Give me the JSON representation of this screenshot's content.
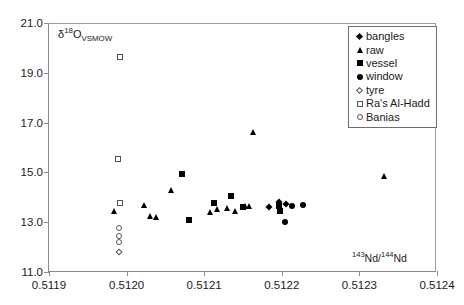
{
  "chart_data": {
    "type": "scatter",
    "title": "",
    "xlabel": "143Nd/144Nd",
    "ylabel": "d18O VSMOW",
    "xlabel_parts": {
      "sup1": "143",
      "mid": "Nd/",
      "sup2": "144",
      "end": "Nd"
    },
    "ylabel_parts": {
      "delta": "δ",
      "sup": "18",
      "element": "O",
      "sub": "VSMOW"
    },
    "xlim": [
      0.5119,
      0.5124
    ],
    "ylim": [
      11.0,
      21.0
    ],
    "xticks": [
      0.5119,
      0.512,
      0.5121,
      0.5122,
      0.5123,
      0.5124
    ],
    "xtick_labels": [
      "0.5119",
      "0.5120",
      "0.5121",
      "0.5122",
      "0.5123",
      "0.5124"
    ],
    "yticks": [
      11.0,
      13.0,
      15.0,
      17.0,
      19.0,
      21.0
    ],
    "ytick_labels": [
      "11.0",
      "13.0",
      "15.0",
      "17.0",
      "19.0",
      "21.0"
    ],
    "grid": false,
    "legend_position": "top-right",
    "marker_color": "#000000",
    "open_marker_edge_color": "#555555",
    "axis_color": "#8a8a8a",
    "series": [
      {
        "name": "bangles",
        "marker": "filled-diamond",
        "points": [
          {
            "x": 0.512184,
            "y": 13.62
          },
          {
            "x": 0.512196,
            "y": 13.8
          },
          {
            "x": 0.512205,
            "y": 13.74
          }
        ]
      },
      {
        "name": "raw",
        "marker": "filled-triangle",
        "points": [
          {
            "x": 0.511984,
            "y": 13.44
          },
          {
            "x": 0.512023,
            "y": 13.7
          },
          {
            "x": 0.51203,
            "y": 13.24
          },
          {
            "x": 0.512038,
            "y": 13.22
          },
          {
            "x": 0.512057,
            "y": 14.28
          },
          {
            "x": 0.512107,
            "y": 13.42
          },
          {
            "x": 0.512117,
            "y": 13.52
          },
          {
            "x": 0.51213,
            "y": 13.56
          },
          {
            "x": 0.51214,
            "y": 13.46
          },
          {
            "x": 0.512152,
            "y": 13.66
          },
          {
            "x": 0.512158,
            "y": 13.66
          },
          {
            "x": 0.512163,
            "y": 16.62
          },
          {
            "x": 0.512332,
            "y": 14.86
          }
        ]
      },
      {
        "name": "vessel",
        "marker": "filled-square",
        "points": [
          {
            "x": 0.512072,
            "y": 14.92
          },
          {
            "x": 0.51208,
            "y": 13.08
          },
          {
            "x": 0.512112,
            "y": 13.78
          },
          {
            "x": 0.512135,
            "y": 14.04
          },
          {
            "x": 0.51215,
            "y": 13.62
          },
          {
            "x": 0.512196,
            "y": 13.66
          },
          {
            "x": 0.512198,
            "y": 13.44
          }
        ]
      },
      {
        "name": "window",
        "marker": "filled-circle",
        "points": [
          {
            "x": 0.512213,
            "y": 13.66
          },
          {
            "x": 0.512204,
            "y": 13.02
          },
          {
            "x": 0.512227,
            "y": 13.7
          }
        ]
      },
      {
        "name": "tyre",
        "marker": "open-diamond",
        "points": [
          {
            "x": 0.51199,
            "y": 11.8
          }
        ]
      },
      {
        "name": "Ra's Al-Hadd",
        "marker": "open-square",
        "points": [
          {
            "x": 0.511991,
            "y": 19.62
          },
          {
            "x": 0.511989,
            "y": 15.52
          },
          {
            "x": 0.511992,
            "y": 13.78
          }
        ]
      },
      {
        "name": "Banias",
        "marker": "open-circle",
        "points": [
          {
            "x": 0.51199,
            "y": 12.78
          },
          {
            "x": 0.51199,
            "y": 12.46
          },
          {
            "x": 0.51199,
            "y": 12.2
          }
        ]
      }
    ]
  },
  "legend": {
    "items": [
      {
        "label": "bangles",
        "marker": "filled-diamond"
      },
      {
        "label": "raw",
        "marker": "filled-triangle"
      },
      {
        "label": "vessel",
        "marker": "filled-square"
      },
      {
        "label": "window",
        "marker": "filled-circle"
      },
      {
        "label": "tyre",
        "marker": "open-diamond"
      },
      {
        "label": "Ra's Al-Hadd",
        "marker": "open-square"
      },
      {
        "label": "Banias",
        "marker": "open-circle"
      }
    ]
  }
}
